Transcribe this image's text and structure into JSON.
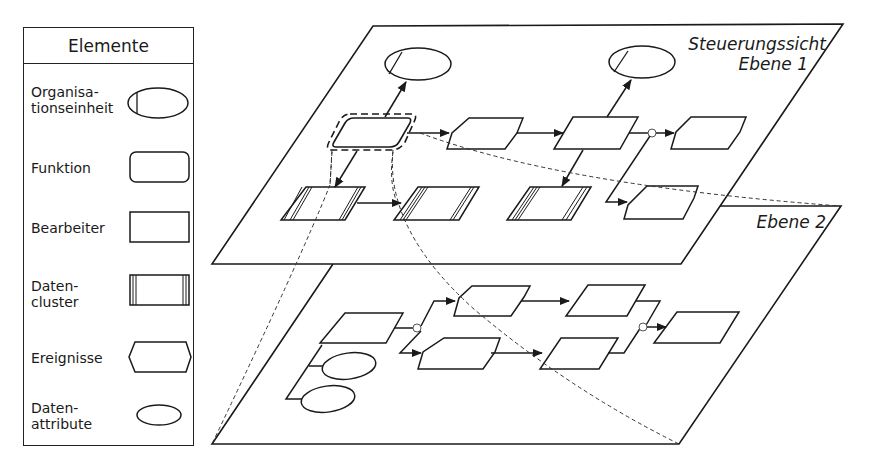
{
  "legend": {
    "title": "Elemente",
    "items": [
      {
        "label": "Organisa-\ntionseinheit",
        "symbol": "organisation-unit-ellipse"
      },
      {
        "label": "Funktion",
        "symbol": "function-rounded-rect"
      },
      {
        "label": "Bearbeiter",
        "symbol": "processor-rect"
      },
      {
        "label": "Daten-\ncluster",
        "symbol": "data-cluster-rect"
      },
      {
        "label": "Ereignisse",
        "symbol": "event-hexagon"
      },
      {
        "label": "Daten-\nattribute",
        "symbol": "data-attribute-ellipse"
      }
    ]
  },
  "planes": {
    "level1": {
      "title": "Steuerungssicht",
      "subtitle": "Ebene 1"
    },
    "level2": {
      "title": "Ebene 2"
    }
  },
  "colors": {
    "stroke": "#1a1a1a",
    "background": "#ffffff"
  }
}
